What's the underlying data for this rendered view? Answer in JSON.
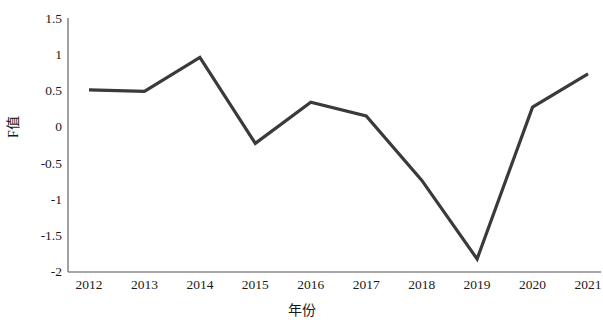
{
  "chart_data": {
    "type": "line",
    "title": "",
    "subtitle": "",
    "xlabel": "年份",
    "ylabel": "F值",
    "categories": [
      "2012",
      "2013",
      "2014",
      "2015",
      "2016",
      "2017",
      "2018",
      "2019",
      "2020",
      "2021"
    ],
    "x": [
      2012,
      2013,
      2014,
      2015,
      2016,
      2017,
      2018,
      2019,
      2020,
      2021
    ],
    "values": [
      0.52,
      0.5,
      0.97,
      -0.22,
      0.35,
      0.16,
      -0.73,
      -1.82,
      0.28,
      0.74
    ],
    "series": [
      {
        "name": "F值",
        "values": [
          0.52,
          0.5,
          0.97,
          -0.22,
          0.35,
          0.16,
          -0.73,
          -1.82,
          0.28,
          0.74
        ],
        "color": "#3a3a3a"
      }
    ],
    "ylim": [
      -2,
      1.5
    ],
    "xlim": [
      2012,
      2021
    ],
    "y_ticks": [
      1.5,
      1,
      0.5,
      0,
      -0.5,
      -1,
      -1.5,
      -2
    ],
    "y_tick_labels": [
      "1.5",
      "1",
      "0.5",
      "0",
      "-0.5",
      "-1",
      "-1.5",
      "-2"
    ],
    "x_tick_labels": [
      "2012",
      "2013",
      "2014",
      "2015",
      "2016",
      "2017",
      "2018",
      "2019",
      "2020",
      "2021"
    ],
    "grid": false,
    "legend": false,
    "legend_position": "none",
    "markers": false,
    "line_width": 3,
    "axis_color": "#8a8a8a",
    "line_color": "#3a3a3a",
    "background_color": "#ffffff",
    "annotations": []
  },
  "axes": {
    "y_title": "F值",
    "x_title": "年份"
  }
}
